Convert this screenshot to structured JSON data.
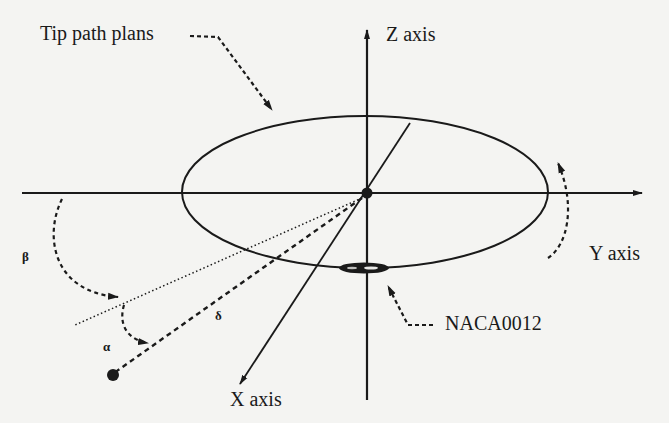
{
  "diagram": {
    "labels": {
      "tip_path": "Tip path plans",
      "z_axis": "Z axis",
      "y_axis": "Y axis",
      "x_axis": "X axis",
      "airfoil": "NACA0012",
      "beta": "β",
      "alpha": "α",
      "delta": "δ"
    },
    "colors": {
      "ink": "#1a1a1a",
      "background": "#f4f4f2"
    }
  }
}
